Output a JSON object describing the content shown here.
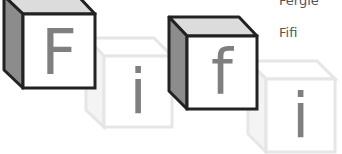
{
  "labels": {
    "name_1": "Fergie",
    "name_2": "Fifi"
  },
  "blocks": [
    {
      "letter": "F",
      "style": "dark"
    },
    {
      "letter": "i",
      "style": "light"
    },
    {
      "letter": "f",
      "style": "dark"
    },
    {
      "letter": "i",
      "style": "light"
    }
  ],
  "colors": {
    "dark_edge": "#222222",
    "dark_top": "#dcdcdc",
    "dark_side": "#8c8c8c",
    "light_edge": "#e6e6e6",
    "light_side": "#f4f4f4",
    "glyph": "#7f7f7f",
    "label": "#555555"
  }
}
